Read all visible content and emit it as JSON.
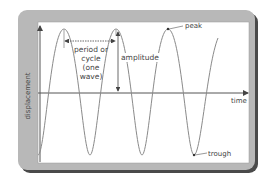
{
  "diagram": {
    "type": "wave-anatomy",
    "axes": {
      "x_label": "time",
      "y_label": "displacement"
    },
    "annotations": {
      "period": [
        "period or",
        "cycle",
        "(one",
        "wave)"
      ],
      "amplitude": "amplitude",
      "peak": "peak",
      "trough": "trough"
    },
    "colors": {
      "frame": "#b5b5b5",
      "frame_shadow": "#5a5a5a",
      "plot_bg": "#ffffff",
      "wave": "#8a8a8a",
      "axis": "#555555",
      "text": "#444444"
    }
  }
}
